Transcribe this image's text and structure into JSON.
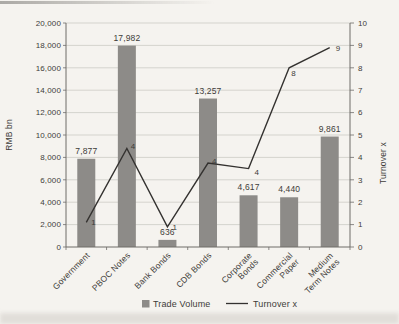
{
  "legend": {
    "trade_volume": "Trade Volume",
    "turnover": "Turnover x"
  },
  "chart_data": {
    "type": "bar+line",
    "categories": [
      "Government",
      "PBOC Notes",
      "Bank Bonds",
      "CDB Bonds",
      "Corporate Bonds",
      "Commercial Paper",
      "Medium Term Notes"
    ],
    "category_label_lines": [
      [
        "Government"
      ],
      [
        "PBOC Notes"
      ],
      [
        "Bank Bonds"
      ],
      [
        "CDB Bonds"
      ],
      [
        "Corporate",
        "Bonds"
      ],
      [
        "Commercial",
        "Paper"
      ],
      [
        "Medium",
        "Term Notes"
      ]
    ],
    "series": [
      {
        "name": "Trade Volume",
        "type": "bar",
        "axis": "left",
        "values": [
          7877,
          17982,
          636,
          13257,
          4617,
          4440,
          9861
        ],
        "labels": [
          "7,877",
          "17,982",
          "636",
          "13,257",
          "4,617",
          "4,440",
          "9,861"
        ],
        "color": "#8d8b88"
      },
      {
        "name": "Turnover x",
        "type": "line",
        "axis": "right",
        "values": [
          1.1,
          4.4,
          0.9,
          3.75,
          3.5,
          8,
          8.9
        ],
        "labels": [
          "1",
          "4",
          "1",
          "4",
          "4",
          "8",
          "9"
        ],
        "color": "#343230"
      }
    ],
    "left_axis": {
      "label": "RMB bn",
      "min": 0,
      "max": 20000,
      "step": 2000,
      "tick_labels": [
        "0",
        "2,000",
        "4,000",
        "6,000",
        "8,000",
        "10,000",
        "12,000",
        "14,000",
        "16,000",
        "18,000",
        "20,000"
      ]
    },
    "right_axis": {
      "label": "Turnover x",
      "min": 0,
      "max": 10,
      "step": 1,
      "tick_labels": [
        "0",
        "1",
        "2",
        "3",
        "4",
        "5",
        "6",
        "7",
        "8",
        "9",
        "10"
      ]
    },
    "legend_position": "bottom",
    "grid": true,
    "colors": {
      "grid": "#c7c5c0",
      "axis": "#6e6c69",
      "text": "#3e3c39"
    }
  }
}
